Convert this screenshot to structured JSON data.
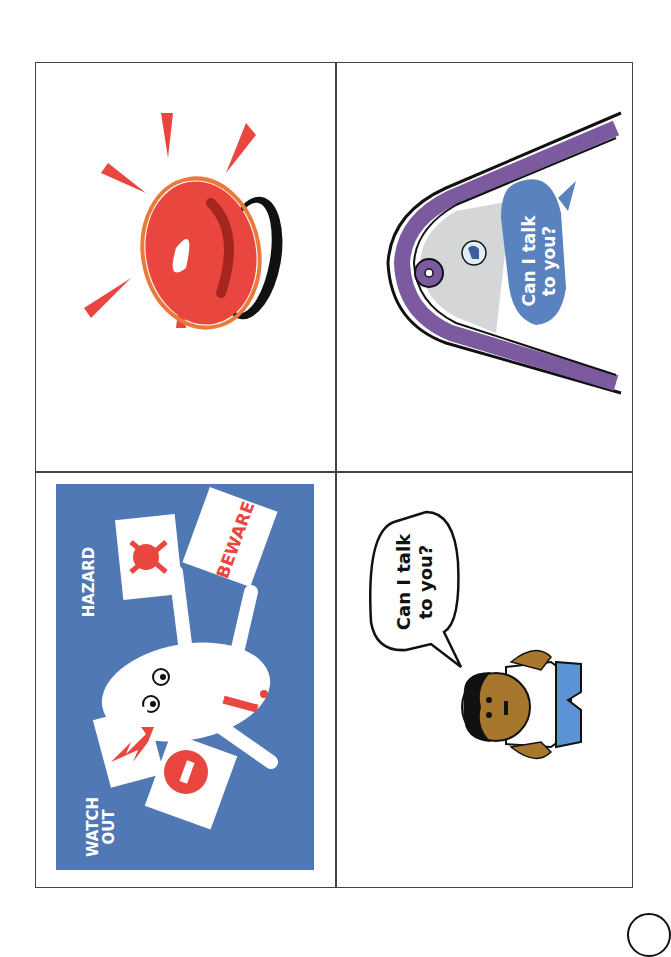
{
  "document": {
    "layout": "2x2 picture card grid, rotated 90 degrees",
    "colors": {
      "grid_line": "#444444",
      "hazard_blue": "#4f78b4",
      "alarm_red": "#e8463e",
      "alarm_orange": "#ea7a3a",
      "phone_purple": "#7b5aa0",
      "screen_grey": "#d4d6d8",
      "bubble_blue": "#5a82bf",
      "skin_brown": "#a8772e",
      "shirt_blue": "#5b93d6"
    }
  },
  "cards": {
    "alarm": {
      "icon": "red-alarm-siren-icon"
    },
    "phone": {
      "icon": "smartphone-icon",
      "bubble_line1": "Can I talk",
      "bubble_line2": "to you?"
    },
    "hazard": {
      "icon": "hazard-character-icon",
      "label_hazard": "HAZARD",
      "label_beware": "BEWARE",
      "label_watch": "WATCH",
      "label_out": "OUT"
    },
    "person": {
      "icon": "person-speaking-icon",
      "bubble_line1": "Can I talk",
      "bubble_line2": "to you?"
    }
  }
}
